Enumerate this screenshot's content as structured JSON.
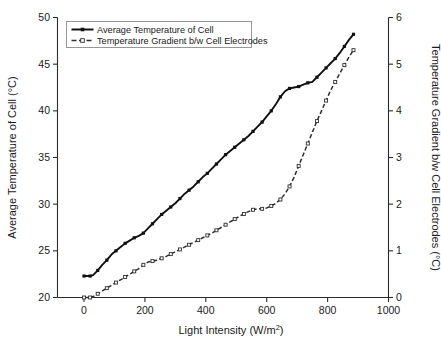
{
  "chart_data": {
    "type": "line",
    "title": "",
    "xlabel": "Light Intensity (W/m2)",
    "xlabel_display": "Light Intensity (W/m",
    "xlabel_sup": "2",
    "xlabel_tail": ")",
    "ylabel_left": "Average Temperature of Cell (°C)",
    "ylabel_right": "Temperature Gradient b/w Cell Electrodes (°C)",
    "xlim": [
      0,
      1000
    ],
    "ylim_left": [
      20,
      50
    ],
    "ylim_right": [
      0,
      6
    ],
    "xticks": [
      0,
      200,
      400,
      600,
      800,
      1000
    ],
    "yticks_left": [
      20,
      25,
      30,
      35,
      40,
      45,
      50
    ],
    "yticks_right": [
      0,
      1,
      2,
      3,
      4,
      5,
      6
    ],
    "grid": false,
    "legend_position": "upper-left-inside",
    "series": [
      {
        "name": "Average Temperature of Cell",
        "axis": "left",
        "marker": "filled-square",
        "linestyle": "solid",
        "color": "#111111",
        "x": [
          0,
          10,
          20,
          30,
          45,
          60,
          75,
          90,
          105,
          120,
          135,
          150,
          165,
          180,
          195,
          210,
          225,
          240,
          255,
          270,
          285,
          300,
          315,
          330,
          345,
          360,
          375,
          390,
          405,
          420,
          435,
          450,
          465,
          480,
          495,
          510,
          525,
          540,
          555,
          570,
          585,
          600,
          615,
          630,
          645,
          660,
          675,
          690,
          705,
          720,
          735,
          750,
          765,
          780,
          795,
          810,
          825,
          840,
          855,
          870,
          885
        ],
        "y": [
          22.3,
          22.3,
          22.3,
          22.4,
          22.9,
          23.5,
          24.0,
          24.6,
          25.0,
          25.4,
          25.8,
          26.1,
          26.4,
          26.6,
          26.9,
          27.4,
          27.9,
          28.4,
          28.9,
          29.3,
          29.7,
          30.1,
          30.6,
          31.1,
          31.5,
          31.9,
          32.4,
          32.9,
          33.3,
          33.8,
          34.3,
          34.8,
          35.3,
          35.7,
          36.1,
          36.5,
          36.9,
          37.3,
          37.8,
          38.3,
          38.8,
          39.4,
          40.0,
          40.7,
          41.5,
          42.1,
          42.4,
          42.5,
          42.6,
          42.8,
          43.0,
          43.1,
          43.6,
          44.1,
          44.6,
          45.1,
          45.6,
          46.2,
          46.9,
          47.6,
          48.2
        ]
      },
      {
        "name": "Temperature Gradient b/w Cell Electrodes",
        "axis": "right",
        "marker": "open-square",
        "linestyle": "dashed",
        "color": "#2e2e2e",
        "x": [
          0,
          10,
          20,
          30,
          45,
          60,
          75,
          90,
          105,
          120,
          135,
          150,
          165,
          180,
          195,
          210,
          225,
          240,
          255,
          270,
          285,
          300,
          315,
          330,
          345,
          360,
          375,
          390,
          405,
          420,
          435,
          450,
          465,
          480,
          495,
          510,
          525,
          540,
          555,
          570,
          585,
          600,
          615,
          630,
          645,
          660,
          675,
          690,
          705,
          720,
          735,
          750,
          765,
          780,
          795,
          810,
          825,
          840,
          855,
          870,
          885
        ],
        "y": [
          0.0,
          0.0,
          0.0,
          0.02,
          0.08,
          0.14,
          0.2,
          0.26,
          0.32,
          0.38,
          0.44,
          0.5,
          0.56,
          0.62,
          0.7,
          0.76,
          0.78,
          0.8,
          0.84,
          0.88,
          0.93,
          0.98,
          1.03,
          1.08,
          1.13,
          1.18,
          1.23,
          1.28,
          1.33,
          1.38,
          1.44,
          1.5,
          1.56,
          1.62,
          1.68,
          1.74,
          1.79,
          1.84,
          1.88,
          1.9,
          1.9,
          1.92,
          1.96,
          2.02,
          2.1,
          2.22,
          2.38,
          2.58,
          2.82,
          3.06,
          3.3,
          3.54,
          3.78,
          4.0,
          4.22,
          4.44,
          4.62,
          4.8,
          4.98,
          5.15,
          5.3
        ]
      }
    ]
  },
  "legend": {
    "entries": [
      {
        "label": "Average Temperature of Cell"
      },
      {
        "label": "Temperature Gradient b/w Cell Electrodes"
      }
    ]
  },
  "colors": {
    "series_solid": "#111111",
    "series_dashed": "#2e2e2e",
    "axis": "#2b2b2b",
    "background": "#ffffff"
  }
}
